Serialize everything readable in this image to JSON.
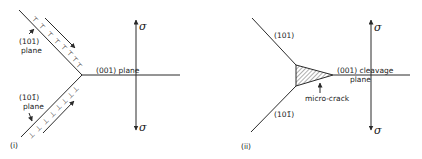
{
  "panel_i": {
    "label": "(i)",
    "upper_plane_label_1": "(101)",
    "upper_plane_label_2": "plane",
    "lower_plane_label_1": "(101̄)",
    "lower_plane_label_2": "plane",
    "horizontal_plane_label": "(001) plane",
    "stress_top": "σ",
    "stress_bottom": "σ",
    "dislocation_symbol": "⊤",
    "dislocation_symbol_lower": "⊥"
  },
  "panel_ii": {
    "label": "(ii)",
    "upper_plane_label": "(101)",
    "lower_plane_label": "(101̄)",
    "horizontal_plane_label_1": "(001) cleavage",
    "horizontal_plane_label_2": "plane",
    "crack_label": "micro-crack",
    "stress_top": "σ",
    "stress_bottom": "σ"
  },
  "colors": {
    "ink": "#2a2a2a",
    "background": "#ffffff"
  }
}
